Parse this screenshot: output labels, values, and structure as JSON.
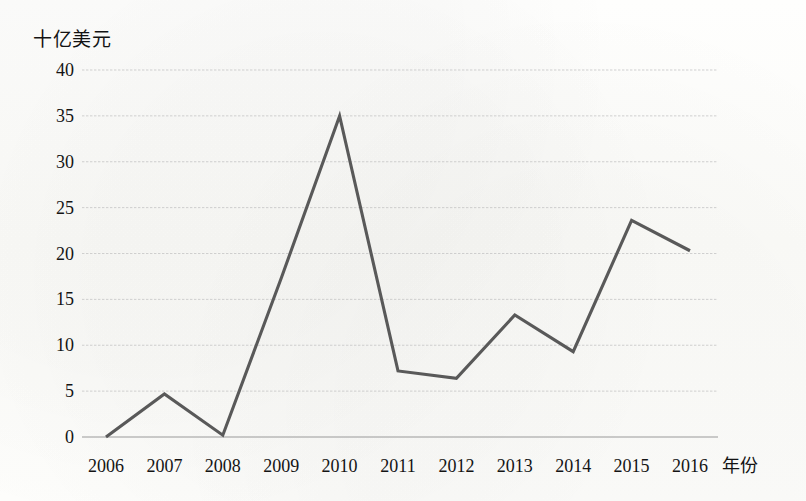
{
  "chart_data": {
    "type": "line",
    "title": "",
    "subtitle": "",
    "xlabel": "年份",
    "ylabel": "十亿美元",
    "categories": [
      "2006",
      "2007",
      "2008",
      "2009",
      "2010",
      "2011",
      "2012",
      "2013",
      "2014",
      "2015",
      "2016"
    ],
    "values": [
      0.0,
      4.7,
      0.2,
      17.3,
      35.0,
      7.2,
      6.4,
      13.3,
      9.3,
      23.6,
      20.3
    ],
    "series": [
      {
        "name": "",
        "values": [
          0.0,
          4.7,
          0.2,
          17.3,
          35.0,
          7.2,
          6.4,
          13.3,
          9.3,
          23.6,
          20.3
        ]
      }
    ],
    "ylim": [
      0,
      40
    ],
    "ytick_labels": [
      "40",
      "35",
      "30",
      "25",
      "20",
      "15",
      "10",
      "5",
      "0"
    ],
    "ytick_values": [
      40,
      35,
      30,
      25,
      20,
      15,
      10,
      5,
      0
    ],
    "grid": true,
    "grid_axis": "y",
    "legend": false,
    "legend_position": "none",
    "markers": false,
    "annotations": []
  },
  "style": {
    "line_color": "#595959",
    "grid_color": "#c8c8c8",
    "axis_color": "#9a9a9a",
    "text_color": "#141414",
    "background": "#fdfdfb"
  }
}
